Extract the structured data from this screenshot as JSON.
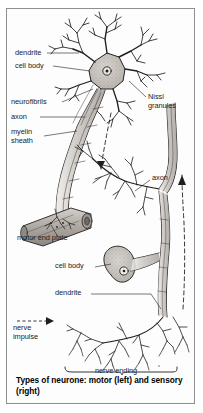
{
  "figure": {
    "caption": "Types of neurone: motor (left) and sensory (right)",
    "background_color": "#fdfdfd",
    "border_color": "#8d8f91",
    "ink_color": "#1b1b1b"
  },
  "labels": {
    "dendrite_top": "dendrite",
    "cell_body_top": "cell body",
    "neurofibrils": "neurofibrils",
    "axon_left": "axon",
    "myelin_sheath_line1": "myelin",
    "myelin_sheath_line2": "sheath",
    "nissl_line1": "Nissl",
    "nissl_line2": "granules",
    "motor_end_plate": "motor end plate",
    "axon_right": "axon",
    "cell_body_bottom": "cell body",
    "dendrite_bottom": "dendrite",
    "nerve_impulse_line1": "nerve",
    "nerve_impulse_line2": "impulse",
    "nerve_ending": "nerve ending"
  }
}
